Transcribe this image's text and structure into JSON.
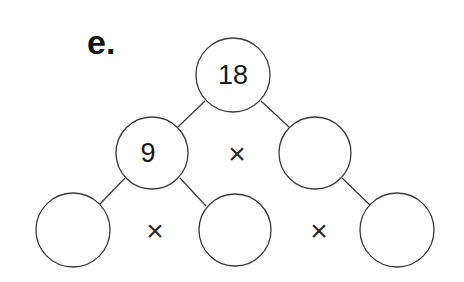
{
  "problem": {
    "label": "e.",
    "type": "factor tree",
    "nodes": [
      {
        "id": "root",
        "value": "18"
      },
      {
        "id": "mid-left",
        "value": "9"
      },
      {
        "id": "mid-right",
        "value": ""
      },
      {
        "id": "bottom-left",
        "value": ""
      },
      {
        "id": "bottom-middle",
        "value": ""
      },
      {
        "id": "bottom-right",
        "value": ""
      }
    ],
    "operators": {
      "middle_row": "×",
      "bottom_left": "×",
      "bottom_right": "×"
    }
  }
}
